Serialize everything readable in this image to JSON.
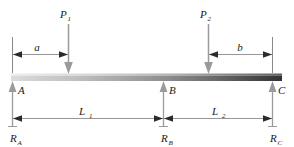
{
  "figure": {
    "kind": "beam-free-body-diagram",
    "background_color": "#ffffff",
    "line_color": "#7a7a7a",
    "text_color": "#1a1a1a",
    "beam": {
      "gradient_light": "#d8d8d8",
      "gradient_mid": "#9a9a9a",
      "gradient_dark": "#3a3a3a"
    }
  },
  "loads": [
    {
      "name": "load-p1",
      "label": "P",
      "subscript": "1",
      "direction": "down"
    },
    {
      "name": "load-p2",
      "label": "P",
      "subscript": "2",
      "direction": "down"
    }
  ],
  "supports": [
    {
      "name": "support-a",
      "label": "A",
      "reaction": "R",
      "reaction_subscript": "A",
      "direction": "up"
    },
    {
      "name": "support-b",
      "label": "B",
      "reaction": "R",
      "reaction_subscript": "B",
      "direction": "up"
    },
    {
      "name": "support-c",
      "label": "C",
      "reaction": "R",
      "reaction_subscript": "C",
      "direction": "up"
    }
  ],
  "dimensions": [
    {
      "name": "dimension-a",
      "label": "a",
      "subscript": "",
      "from": "A",
      "to": "P1",
      "position": "top"
    },
    {
      "name": "dimension-b",
      "label": "b",
      "subscript": "",
      "from": "P2",
      "to": "C",
      "position": "top"
    },
    {
      "name": "dimension-l1",
      "label": "L",
      "subscript": "1",
      "from": "A",
      "to": "B",
      "position": "bottom"
    },
    {
      "name": "dimension-l2",
      "label": "L",
      "subscript": "2",
      "from": "B",
      "to": "C",
      "position": "bottom"
    }
  ]
}
